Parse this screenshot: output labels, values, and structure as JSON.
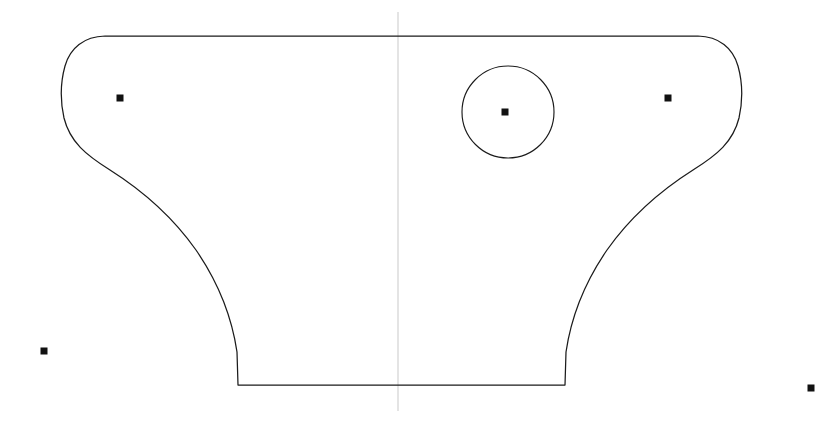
{
  "drawing": {
    "title": "Symmetric Bracket / Column Capital Profile",
    "background_color": "#ffffff",
    "outline_color": "#1b1b1b",
    "axis_color": "#c9c9c9",
    "marker_color": "#111111",
    "width": 840,
    "height": 424,
    "units": "pixels",
    "view": "front elevation",
    "symmetry": "bilateral about vertical centerline"
  },
  "center_axis": {
    "label": "vertical centerline",
    "x": 398,
    "y_start": 12,
    "y_end": 411,
    "style": "thin light gray line"
  },
  "outline": {
    "label": "part outline",
    "description": "Wide flat top edge with rounded bulbous lobes at left and right ends, concave waisted sides sweeping inward and downward to a narrow flat rectangular base.",
    "top_edge": {
      "y": 36,
      "x_start": 105,
      "x_end": 700
    },
    "base_edge": {
      "y": 385,
      "x_start": 238,
      "x_end": 565
    },
    "left_extreme_x": 62,
    "right_extreme_x": 738,
    "lobe_center_y": 98,
    "path": "M 105 36 C 84 36.5 70 48 65 66 C 60 84 60 100 64 118 C 70 142 86 155 110 170 C 140 189 172 216 196 250 C 218 282 232 318 237 352 L 238 385 L 565 385 L 566 352 C 571 318 585 282 607 250 C 631 216 663 189 693 170 C 717 155 733 142 739 118 C 743 100 743 84 738 66 C 733 48 719 36.5 698 36 Z"
  },
  "circle_feature": {
    "label": "through hole",
    "center_x": 508,
    "center_y": 112,
    "radius": 46,
    "diameter": 92
  },
  "markers": [
    {
      "name": "left-lobe-center-marker",
      "x": 120,
      "y": 98,
      "size": 7,
      "description": "center point marker inside left lobe"
    },
    {
      "name": "hole-center-marker",
      "x": 505,
      "y": 112,
      "size": 7,
      "description": "center point marker at circle center"
    },
    {
      "name": "right-lobe-center-marker",
      "x": 668,
      "y": 98,
      "size": 7,
      "description": "center point marker inside right lobe"
    },
    {
      "name": "lower-left-reference-marker",
      "x": 44,
      "y": 351,
      "size": 7,
      "description": "isolated reference point lower left"
    },
    {
      "name": "lower-right-reference-marker",
      "x": 811,
      "y": 388,
      "size": 7,
      "description": "isolated reference point lower right"
    }
  ]
}
